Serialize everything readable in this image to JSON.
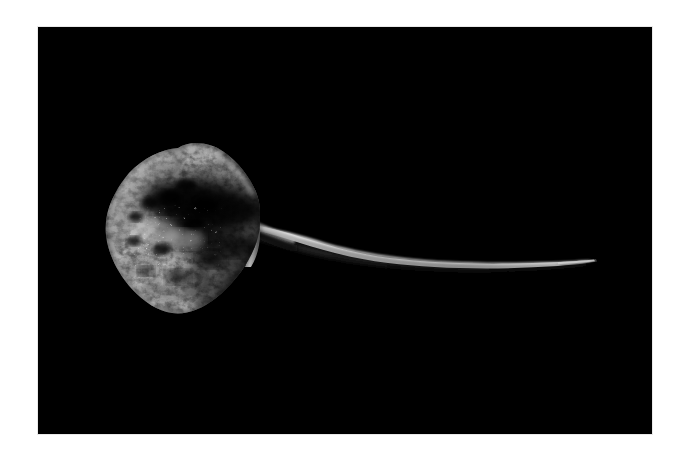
{
  "image": {
    "domain": "Natural-Image",
    "subject": "stingray",
    "description": "A single stingray photographed from above against a plain black background, its long whip-like tail extending to the right.",
    "orientation": "landscape",
    "canvas": {
      "width": 687,
      "height": 463
    },
    "border": {
      "style": "white photographic margin",
      "color": "#ffffff",
      "edge_line_color": "#e9e9e9",
      "left": 38,
      "top": 27,
      "right": 35,
      "bottom": 29
    },
    "photo": {
      "left": 38,
      "top": 27,
      "width": 614,
      "height": 407,
      "background_color": "#000000",
      "palette": {
        "background": "#000000",
        "body_mid_grey": "#8d8d8d",
        "body_light_grey": "#b9b9b9",
        "body_highlight": "#efefef",
        "body_shadow": "#1a1a1a",
        "body_dark_mottle": "#0b0b0b",
        "tail_grey": "#9a9a9a",
        "tail_dark": "#151515"
      }
    },
    "subject_geometry": {
      "body_shape": "diamond / kite disc",
      "body_bounds": {
        "x": 106,
        "y": 155,
        "width": 154,
        "height": 159
      },
      "body_center": {
        "x": 178,
        "y": 236
      },
      "tail_start": {
        "x": 250,
        "y": 238
      },
      "tail_tip": {
        "x": 589,
        "y": 262
      },
      "tail_length_px": 339,
      "pelvic_fin_highlight": {
        "x": 246,
        "y": 208,
        "width": 14,
        "height": 62
      }
    },
    "lighting": {
      "source": "top-left",
      "contrast": "high",
      "mood": "dark, isolated specimen on black"
    }
  },
  "alt_text": "Stingray on black background with long tail"
}
